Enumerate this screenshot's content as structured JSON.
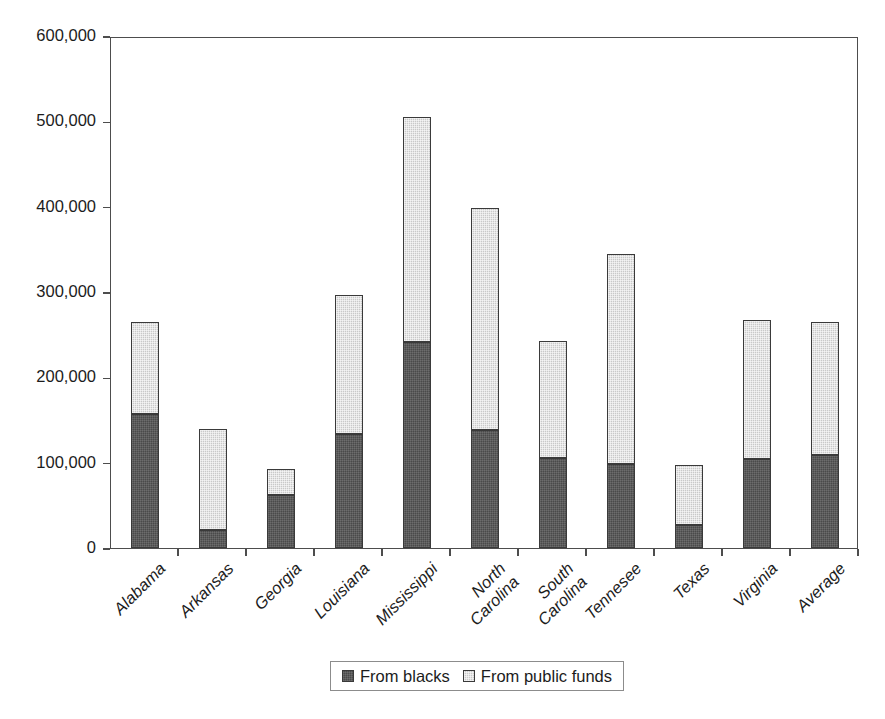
{
  "chart_data": {
    "type": "bar",
    "stacked": true,
    "title": "",
    "subtitle": "",
    "xlabel": "",
    "ylabel": "",
    "ylim": [
      0,
      600000
    ],
    "ytick_values": [
      0,
      100000,
      200000,
      300000,
      400000,
      500000,
      600000
    ],
    "ytick_labels": [
      "0",
      "100,000",
      "200,000",
      "300,000",
      "400,000",
      "500,000",
      "600,000"
    ],
    "grid": false,
    "legend_position": "bottom",
    "categories": [
      "Alabama",
      "Arkansas",
      "Georgia",
      "Louisiana",
      "Mississippi",
      "North\nCarolina",
      "South\nCarolina",
      "Tennesee",
      "Texas",
      "Virginia",
      "Average"
    ],
    "series": [
      {
        "name": "From blacks",
        "color": "#4a4a4a",
        "values": [
          157000,
          21000,
          62000,
          134000,
          241000,
          138000,
          105000,
          98000,
          27000,
          104000,
          109000
        ]
      },
      {
        "name": "From public funds",
        "color": "#c9c9c9",
        "values": [
          108000,
          118000,
          31000,
          162000,
          264000,
          260000,
          138000,
          246000,
          70000,
          163000,
          156000
        ]
      }
    ],
    "totals": [
      265000,
      139000,
      93000,
      296000,
      505000,
      398000,
      243000,
      344000,
      97000,
      267000,
      265000
    ]
  },
  "legend": {
    "entries": [
      {
        "label": "From blacks",
        "swatch": "#4a4a4a"
      },
      {
        "label": "From public funds",
        "swatch": "#c9c9c9"
      }
    ]
  },
  "colors": {
    "axis": "#4d4d4d",
    "text": "#1c1c1c",
    "background": "#ffffff",
    "series_dark": "#4a4a4a",
    "series_light": "#c9c9c9",
    "legend_border": "#8c8c8c"
  }
}
